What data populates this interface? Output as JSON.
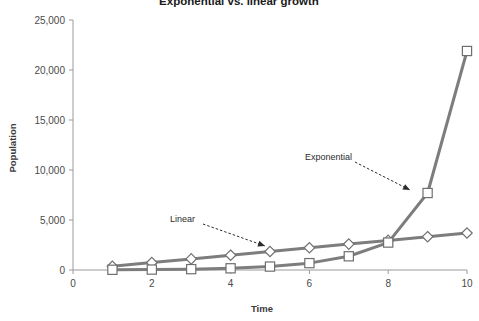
{
  "chart_data": {
    "type": "line",
    "title": "Exponential vs. linear growth",
    "xlabel": "Time",
    "ylabel": "Population",
    "x": [
      1,
      2,
      3,
      4,
      5,
      6,
      7,
      8,
      9,
      10
    ],
    "xlim": [
      0,
      10
    ],
    "ylim": [
      0,
      25000
    ],
    "xticks": [
      0,
      2,
      4,
      6,
      8,
      10
    ],
    "xtick_labels": [
      "0",
      "2",
      "4",
      "6",
      "8",
      "10"
    ],
    "yticks": [
      0,
      5000,
      10000,
      15000,
      20000,
      25000
    ],
    "ytick_labels": [
      "0",
      "5,000",
      "10,000",
      "15,000",
      "20,000",
      "25,000"
    ],
    "grid": false,
    "legend": "none",
    "series": [
      {
        "name": "Linear",
        "marker": "diamond",
        "color": "#7d7d7d",
        "values": [
          370,
          740,
          1110,
          1480,
          1850,
          2220,
          2590,
          2960,
          3330,
          3700
        ]
      },
      {
        "name": "Exponential",
        "marker": "square",
        "color": "#7d7d7d",
        "values": [
          21,
          43,
          86,
          171,
          343,
          686,
          1372,
          2744,
          7700,
          21900
        ]
      }
    ],
    "annotations": [
      {
        "text": "Linear",
        "label_x": 170,
        "label_y": 222,
        "arrow_from_x": 203,
        "arrow_from_y": 224,
        "arrow_to_x": 265,
        "arrow_to_y": 246
      },
      {
        "text": "Exponential",
        "label_x": 305,
        "label_y": 160,
        "arrow_from_x": 355,
        "arrow_from_y": 162,
        "arrow_to_x": 410,
        "arrow_to_y": 190
      }
    ]
  },
  "plot_geometry": {
    "left": 73,
    "right": 467,
    "top": 20,
    "bottom": 270,
    "title_x": 239,
    "title_y": 5,
    "xlabel_x": 262,
    "xlabel_y": 312,
    "ylabel_x": 16,
    "ylabel_y": 148
  }
}
